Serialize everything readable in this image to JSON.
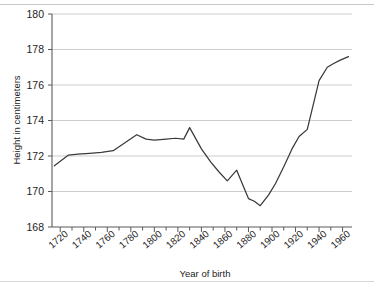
{
  "chart_data": {
    "type": "line",
    "title": "",
    "xlabel": "Year of birth",
    "ylabel": "Height in centimeters",
    "xlim": [
      1713,
      1968
    ],
    "ylim": [
      168,
      180
    ],
    "grid": "horizontal",
    "legend": "none",
    "y_ticks": [
      168,
      170,
      172,
      174,
      176,
      178,
      180
    ],
    "y_tick_labels": [
      "168",
      "170",
      "172",
      "174",
      "176",
      "178",
      "180"
    ],
    "x_ticks": [
      1720,
      1730,
      1740,
      1750,
      1760,
      1770,
      1780,
      1790,
      1800,
      1810,
      1820,
      1830,
      1840,
      1850,
      1860,
      1870,
      1880,
      1890,
      1900,
      1910,
      1920,
      1930,
      1940,
      1950,
      1960
    ],
    "x_tick_labels": [
      "1720",
      "1740",
      "1760",
      "1780",
      "1800",
      "1820",
      "1840",
      "1860",
      "1880",
      "1900",
      "1920",
      "1940",
      "1960"
    ],
    "x_major_ticks": [
      1720,
      1740,
      1760,
      1780,
      1800,
      1820,
      1840,
      1860,
      1880,
      1900,
      1920,
      1940,
      1960
    ],
    "line_color": "#3a3a3a",
    "grid_color": "#c7c7c7",
    "series": [
      {
        "name": "Height",
        "x": [
          1715,
          1727,
          1735,
          1745,
          1755,
          1765,
          1775,
          1785,
          1793,
          1800,
          1810,
          1818,
          1825,
          1830,
          1840,
          1848,
          1855,
          1862,
          1870,
          1875,
          1880,
          1885,
          1890,
          1897,
          1903,
          1910,
          1917,
          1923,
          1930,
          1934,
          1940,
          1947,
          1952,
          1958,
          1965
        ],
        "y": [
          171.45,
          172.05,
          172.1,
          172.15,
          172.2,
          172.3,
          172.75,
          173.2,
          172.95,
          172.9,
          172.95,
          173.0,
          172.95,
          173.6,
          172.4,
          171.65,
          171.1,
          170.6,
          171.2,
          170.4,
          169.6,
          169.45,
          169.2,
          169.8,
          170.45,
          171.4,
          172.4,
          173.1,
          173.5,
          174.6,
          176.25,
          177.0,
          177.2,
          177.4,
          177.6
        ]
      }
    ]
  },
  "axes": {
    "y_title": "Height in centimeters",
    "x_title": "Year of birth"
  }
}
